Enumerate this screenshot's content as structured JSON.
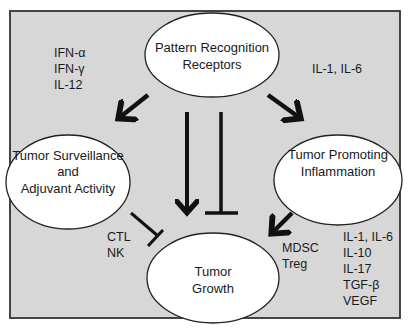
{
  "colors": {
    "background": "#d7d7d7",
    "frame_border": "#333333",
    "node_fill": "#ffffff",
    "node_stroke": "#222222",
    "arrow": "#111111",
    "text": "#1a1a1a"
  },
  "nodes": {
    "prr": {
      "line1": "Pattern Recognition",
      "line2": "Receptors"
    },
    "surveillance": {
      "line1": "Tumor Surveillance",
      "line2": "and",
      "line3": "Adjuvant Activity"
    },
    "promoting": {
      "line1": "Tumor Promoting",
      "line2": "Inflammation"
    },
    "growth": {
      "line1": "Tumor",
      "line2": "Growth"
    }
  },
  "labels": {
    "surveillance_cytokines": [
      "IFN-α",
      "IFN-γ",
      "IL-12"
    ],
    "inflammation_cytokines": [
      "IL-1, IL-6"
    ],
    "effector_cells": [
      "CTL",
      "NK"
    ],
    "suppressor_cells": [
      "MDSC",
      "Treg"
    ],
    "growth_factors": [
      "IL-1, IL-6",
      "IL-10",
      "IL-17",
      "TGF-β",
      "VEGF"
    ]
  },
  "edges": [
    {
      "from": "prr",
      "to": "surveillance",
      "type": "activate"
    },
    {
      "from": "prr",
      "to": "promoting",
      "type": "activate"
    },
    {
      "from": "prr",
      "to": "growth",
      "type": "activate"
    },
    {
      "from": "prr",
      "to": "growth",
      "type": "inhibit"
    },
    {
      "from": "surveillance",
      "to": "growth",
      "type": "inhibit"
    },
    {
      "from": "promoting",
      "to": "growth",
      "type": "activate"
    }
  ]
}
